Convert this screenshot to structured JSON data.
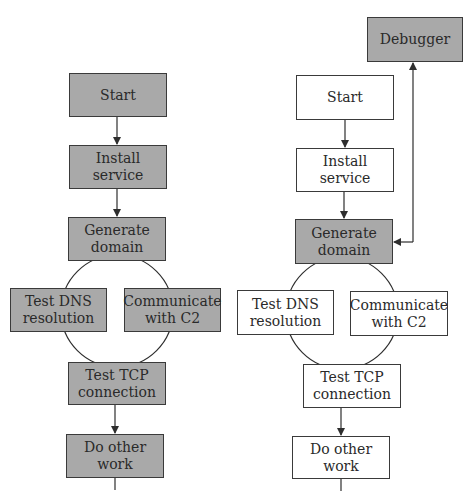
{
  "colors": {
    "highlight_fill": "#a9a9a9",
    "plain_fill": "#ffffff",
    "stroke": "#3a3a3a",
    "text": "#2a2a2a"
  },
  "left_diagram": {
    "nodes": {
      "start": {
        "lines": [
          "Start"
        ],
        "fill": "gray"
      },
      "install_service": {
        "lines": [
          "Install",
          "service"
        ],
        "fill": "gray"
      },
      "generate_domain": {
        "lines": [
          "Generate",
          "domain"
        ],
        "fill": "gray"
      },
      "test_dns": {
        "lines": [
          "Test DNS",
          "resolution"
        ],
        "fill": "gray"
      },
      "communicate_c2": {
        "lines": [
          "Communicate",
          "with C2"
        ],
        "fill": "gray"
      },
      "test_tcp": {
        "lines": [
          "Test TCP",
          "connection"
        ],
        "fill": "gray"
      },
      "do_other_work": {
        "lines": [
          "Do other",
          "work"
        ],
        "fill": "gray"
      }
    }
  },
  "right_diagram": {
    "nodes": {
      "debugger": {
        "lines": [
          "Debugger"
        ],
        "fill": "gray"
      },
      "start": {
        "lines": [
          "Start"
        ],
        "fill": "white"
      },
      "install_service": {
        "lines": [
          "Install",
          "service"
        ],
        "fill": "white"
      },
      "generate_domain": {
        "lines": [
          "Generate",
          "domain"
        ],
        "fill": "gray"
      },
      "test_dns": {
        "lines": [
          "Test DNS",
          "resolution"
        ],
        "fill": "white"
      },
      "communicate_c2": {
        "lines": [
          "Communicate",
          "with C2"
        ],
        "fill": "white"
      },
      "test_tcp": {
        "lines": [
          "Test TCP",
          "connection"
        ],
        "fill": "white"
      },
      "do_other_work": {
        "lines": [
          "Do other",
          "work"
        ],
        "fill": "white"
      }
    }
  }
}
